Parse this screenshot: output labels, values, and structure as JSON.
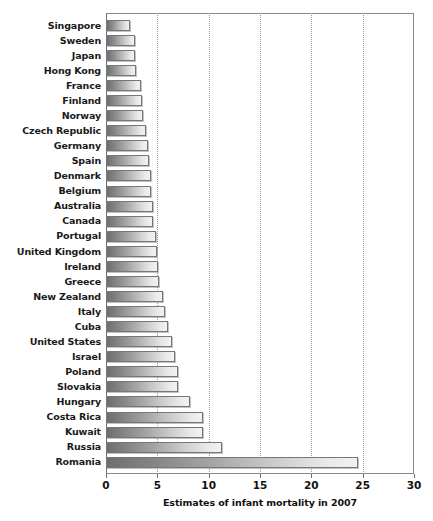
{
  "chart_data": {
    "type": "bar",
    "orientation": "horizontal",
    "title": "",
    "xlabel": "Estimates of infant mortality in 2007",
    "ylabel": "",
    "xlim": [
      0,
      30
    ],
    "xticks": [
      0,
      5,
      10,
      15,
      20,
      25,
      30
    ],
    "xtick_labels": [
      "0",
      "5",
      "10",
      "15",
      "20",
      "25",
      "30"
    ],
    "grid": "vertical dotted gridlines at 5, 10, 15, 20, 25",
    "legend": "none",
    "bar_style": "horizontal gray gradient, dark at left to light at right",
    "categories": [
      "Singapore",
      "Sweden",
      "Japan",
      "Hong Kong",
      "France",
      "Finland",
      "Norway",
      "Czech Republic",
      "Germany",
      "Spain",
      "Denmark",
      "Belgium",
      "Australia",
      "Canada",
      "Portugal",
      "United Kingdom",
      "Ireland",
      "Greece",
      "New Zealand",
      "Italy",
      "Cuba",
      "United States",
      "Israel",
      "Poland",
      "Slovakia",
      "Hungary",
      "Costa Rica",
      "Kuwait",
      "Russia",
      "Romania"
    ],
    "values": [
      2.3,
      2.8,
      2.8,
      2.9,
      3.4,
      3.5,
      3.6,
      3.9,
      4.1,
      4.2,
      4.4,
      4.4,
      4.6,
      4.6,
      4.9,
      5.0,
      5.1,
      5.2,
      5.6,
      5.7,
      6.0,
      6.4,
      6.7,
      7.0,
      7.0,
      8.2,
      9.4,
      9.4,
      11.3,
      24.5
    ]
  },
  "accent_colors": {
    "bar_dark": "#6e6e6e",
    "bar_light": "#f2f2f2",
    "bar_border": "#777777",
    "frame": "#8a8a8a",
    "gridline": "#9a9a9a",
    "text": "#111111"
  }
}
